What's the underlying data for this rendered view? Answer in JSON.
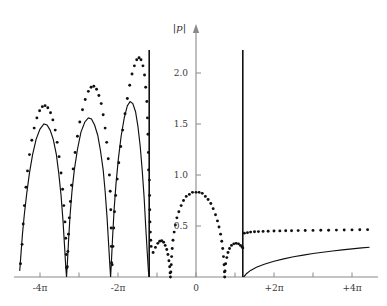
{
  "chart_data": {
    "type": "line",
    "title": "",
    "xlabel": "",
    "ylabel": "|p|",
    "ylim": [
      0,
      2.3
    ],
    "xlim_pi": [
      -4.55,
      4.55
    ],
    "grid": false,
    "legend": "none",
    "x_tick_labels": [
      "-4π",
      "",
      "-2π",
      "",
      "0",
      "",
      "+2π",
      "",
      "+4π"
    ],
    "x_tick_values_pi": [
      -4,
      -3,
      -2,
      -1,
      0,
      1,
      2,
      3,
      4
    ],
    "x_tick_labels_shown": [
      "-4π",
      "-2π",
      "0",
      "+2π",
      "+4π"
    ],
    "y_tick_labels": [
      "0.5",
      "1.0",
      "1.5",
      "2.0"
    ],
    "y_tick_values": [
      0.5,
      1.0,
      1.5,
      2.0
    ],
    "annotations": [
      {
        "label": "vertical asymptote",
        "x_pi": -1.2
      },
      {
        "label": "vertical asymptote",
        "x_pi": 1.2
      }
    ],
    "series": [
      {
        "name": "solid",
        "style": "solid",
        "color": "#101010",
        "points_pi_value": [
          [
            -4.52,
            0.06
          ],
          [
            -4.45,
            0.42
          ],
          [
            -4.4,
            0.62
          ],
          [
            -4.34,
            0.82
          ],
          [
            -4.27,
            1.02
          ],
          [
            -4.19,
            1.2
          ],
          [
            -4.1,
            1.35
          ],
          [
            -4.0,
            1.45
          ],
          [
            -3.9,
            1.5
          ],
          [
            -3.82,
            1.49
          ],
          [
            -3.74,
            1.44
          ],
          [
            -3.66,
            1.35
          ],
          [
            -3.58,
            1.2
          ],
          [
            -3.52,
            1.02
          ],
          [
            -3.46,
            0.8
          ],
          [
            -3.41,
            0.55
          ],
          [
            -3.37,
            0.3
          ],
          [
            -3.34,
            0.1
          ],
          [
            -3.32,
            0.0
          ],
          [
            -3.3,
            0.12
          ],
          [
            -3.27,
            0.34
          ],
          [
            -3.23,
            0.6
          ],
          [
            -3.18,
            0.84
          ],
          [
            -3.12,
            1.05
          ],
          [
            -3.04,
            1.25
          ],
          [
            -2.95,
            1.42
          ],
          [
            -2.85,
            1.52
          ],
          [
            -2.76,
            1.56
          ],
          [
            -2.68,
            1.55
          ],
          [
            -2.6,
            1.49
          ],
          [
            -2.52,
            1.39
          ],
          [
            -2.45,
            1.24
          ],
          [
            -2.38,
            1.05
          ],
          [
            -2.33,
            0.84
          ],
          [
            -2.28,
            0.58
          ],
          [
            -2.24,
            0.32
          ],
          [
            -2.21,
            0.12
          ],
          [
            -2.19,
            0.0
          ],
          [
            -2.17,
            0.14
          ],
          [
            -2.14,
            0.38
          ],
          [
            -2.1,
            0.66
          ],
          [
            -2.05,
            0.92
          ],
          [
            -1.99,
            1.16
          ],
          [
            -1.92,
            1.38
          ],
          [
            -1.84,
            1.56
          ],
          [
            -1.76,
            1.68
          ],
          [
            -1.69,
            1.72
          ],
          [
            -1.62,
            1.7
          ],
          [
            -1.55,
            1.62
          ],
          [
            -1.49,
            1.48
          ],
          [
            -1.43,
            1.28
          ],
          [
            -1.38,
            1.05
          ],
          [
            -1.33,
            0.78
          ],
          [
            -1.29,
            0.5
          ],
          [
            -1.25,
            0.24
          ],
          [
            -1.22,
            0.06
          ],
          [
            -1.205,
            0.0
          ],
          [
            1.22,
            0.0
          ],
          [
            1.3,
            0.035
          ],
          [
            1.4,
            0.065
          ],
          [
            1.55,
            0.095
          ],
          [
            1.75,
            0.125
          ],
          [
            2.0,
            0.155
          ],
          [
            2.25,
            0.178
          ],
          [
            2.5,
            0.198
          ],
          [
            2.75,
            0.215
          ],
          [
            3.0,
            0.23
          ],
          [
            3.25,
            0.243
          ],
          [
            3.5,
            0.255
          ],
          [
            3.75,
            0.266
          ],
          [
            4.0,
            0.276
          ],
          [
            4.25,
            0.285
          ],
          [
            4.45,
            0.292
          ]
        ]
      },
      {
        "name": "dotted",
        "style": "dotted",
        "color": "#101010",
        "points_pi_value": [
          [
            -4.5,
            0.13
          ],
          [
            -4.46,
            0.32
          ],
          [
            -4.43,
            0.52
          ],
          [
            -4.4,
            0.7
          ],
          [
            -4.36,
            0.88
          ],
          [
            -4.32,
            1.04
          ],
          [
            -4.27,
            1.2
          ],
          [
            -4.21,
            1.34
          ],
          [
            -4.15,
            1.46
          ],
          [
            -4.08,
            1.56
          ],
          [
            -4.01,
            1.63
          ],
          [
            -3.94,
            1.67
          ],
          [
            -3.87,
            1.68
          ],
          [
            -3.8,
            1.66
          ],
          [
            -3.73,
            1.61
          ],
          [
            -3.67,
            1.54
          ],
          [
            -3.61,
            1.44
          ],
          [
            -3.56,
            1.32
          ],
          [
            -3.51,
            1.18
          ],
          [
            -3.46,
            1.02
          ],
          [
            -3.42,
            0.86
          ],
          [
            -3.39,
            0.7
          ],
          [
            -3.36,
            0.54
          ],
          [
            -3.34,
            0.38
          ],
          [
            -3.325,
            0.22
          ],
          [
            -3.315,
            0.09
          ],
          [
            -3.3,
            0.1
          ],
          [
            -3.285,
            0.25
          ],
          [
            -3.27,
            0.42
          ],
          [
            -3.25,
            0.58
          ],
          [
            -3.22,
            0.74
          ],
          [
            -3.19,
            0.9
          ],
          [
            -3.15,
            1.06
          ],
          [
            -3.1,
            1.22
          ],
          [
            -3.04,
            1.38
          ],
          [
            -2.98,
            1.52
          ],
          [
            -2.91,
            1.64
          ],
          [
            -2.84,
            1.74
          ],
          [
            -2.76,
            1.82
          ],
          [
            -2.69,
            1.86
          ],
          [
            -2.62,
            1.87
          ],
          [
            -2.55,
            1.84
          ],
          [
            -2.49,
            1.78
          ],
          [
            -2.43,
            1.7
          ],
          [
            -2.38,
            1.59
          ],
          [
            -2.33,
            1.46
          ],
          [
            -2.29,
            1.32
          ],
          [
            -2.25,
            1.16
          ],
          [
            -2.22,
            1.0
          ],
          [
            -2.2,
            0.84
          ],
          [
            -2.185,
            0.66
          ],
          [
            -2.175,
            0.48
          ],
          [
            -2.17,
            0.3
          ],
          [
            -2.165,
            0.14
          ],
          [
            -2.15,
            0.12
          ],
          [
            -2.13,
            0.3
          ],
          [
            -2.11,
            0.48
          ],
          [
            -2.09,
            0.64
          ],
          [
            -2.06,
            0.8
          ],
          [
            -2.02,
            0.96
          ],
          [
            -1.98,
            1.12
          ],
          [
            -1.93,
            1.28
          ],
          [
            -1.88,
            1.44
          ],
          [
            -1.82,
            1.6
          ],
          [
            -1.76,
            1.75
          ],
          [
            -1.7,
            1.88
          ],
          [
            -1.64,
            1.99
          ],
          [
            -1.58,
            2.07
          ],
          [
            -1.52,
            2.13
          ],
          [
            -1.46,
            2.15
          ],
          [
            -1.41,
            2.13
          ],
          [
            -1.36,
            2.07
          ],
          [
            -1.32,
            1.98
          ],
          [
            -1.29,
            1.86
          ],
          [
            -1.26,
            1.72
          ],
          [
            -1.245,
            1.56
          ],
          [
            -1.23,
            1.4
          ],
          [
            -1.22,
            1.22
          ],
          [
            -1.215,
            1.05
          ],
          [
            -1.195,
            0.95
          ],
          [
            -1.19,
            0.8
          ],
          [
            -1.185,
            0.66
          ],
          [
            -1.18,
            0.54
          ],
          [
            -1.17,
            0.44
          ],
          [
            -1.16,
            0.36
          ],
          [
            -1.15,
            0.3
          ],
          [
            -1.1,
            0.24
          ],
          [
            -1.04,
            0.29
          ],
          [
            -0.98,
            0.33
          ],
          [
            -0.93,
            0.35
          ],
          [
            -0.88,
            0.355
          ],
          [
            -0.83,
            0.34
          ],
          [
            -0.79,
            0.31
          ],
          [
            -0.75,
            0.27
          ],
          [
            -0.72,
            0.22
          ],
          [
            -0.695,
            0.16
          ],
          [
            -0.675,
            0.1
          ],
          [
            -0.665,
            0.04
          ],
          [
            -0.655,
            0.0
          ],
          [
            -0.645,
            0.05
          ],
          [
            -0.635,
            0.12
          ],
          [
            -0.625,
            0.2
          ],
          [
            -0.61,
            0.28
          ],
          [
            -0.59,
            0.36
          ],
          [
            -0.56,
            0.44
          ],
          [
            -0.53,
            0.51
          ],
          [
            -0.49,
            0.58
          ],
          [
            -0.44,
            0.64
          ],
          [
            -0.38,
            0.7
          ],
          [
            -0.32,
            0.75
          ],
          [
            -0.25,
            0.79
          ],
          [
            -0.17,
            0.81
          ],
          [
            -0.09,
            0.83
          ],
          [
            0.0,
            0.83
          ],
          [
            0.08,
            0.83
          ],
          [
            0.16,
            0.82
          ],
          [
            0.24,
            0.79
          ],
          [
            0.31,
            0.76
          ],
          [
            0.38,
            0.72
          ],
          [
            0.44,
            0.67
          ],
          [
            0.5,
            0.61
          ],
          [
            0.55,
            0.55
          ],
          [
            0.59,
            0.49
          ],
          [
            0.63,
            0.42
          ],
          [
            0.66,
            0.35
          ],
          [
            0.685,
            0.28
          ],
          [
            0.705,
            0.2
          ],
          [
            0.72,
            0.12
          ],
          [
            0.73,
            0.05
          ],
          [
            0.735,
            0.0
          ],
          [
            0.745,
            0.06
          ],
          [
            0.76,
            0.13
          ],
          [
            0.79,
            0.19
          ],
          [
            0.82,
            0.24
          ],
          [
            0.86,
            0.28
          ],
          [
            0.91,
            0.31
          ],
          [
            0.97,
            0.325
          ],
          [
            1.03,
            0.33
          ],
          [
            1.09,
            0.325
          ],
          [
            1.14,
            0.31
          ],
          [
            1.18,
            0.295
          ],
          [
            1.2,
            0.285
          ],
          [
            1.24,
            0.43
          ],
          [
            1.32,
            0.435
          ],
          [
            1.4,
            0.44
          ],
          [
            1.5,
            0.443
          ],
          [
            1.6,
            0.445
          ],
          [
            1.72,
            0.447
          ],
          [
            1.85,
            0.449
          ],
          [
            2.0,
            0.451
          ],
          [
            2.15,
            0.452
          ],
          [
            2.3,
            0.453
          ],
          [
            2.45,
            0.454
          ],
          [
            2.62,
            0.455
          ],
          [
            2.8,
            0.456
          ],
          [
            3.0,
            0.457
          ],
          [
            3.2,
            0.458
          ],
          [
            3.4,
            0.459
          ],
          [
            3.6,
            0.46
          ],
          [
            3.8,
            0.461
          ],
          [
            4.0,
            0.462
          ],
          [
            4.2,
            0.463
          ],
          [
            4.4,
            0.464
          ]
        ]
      }
    ]
  },
  "axes": {
    "y_axis_title": "|p|",
    "origin_label": "0"
  },
  "colors": {
    "curve": "#101010",
    "axis": "#8a8a8a",
    "asymptote": "#121212",
    "label": "#3a3a3a",
    "background": "#ffffff"
  }
}
